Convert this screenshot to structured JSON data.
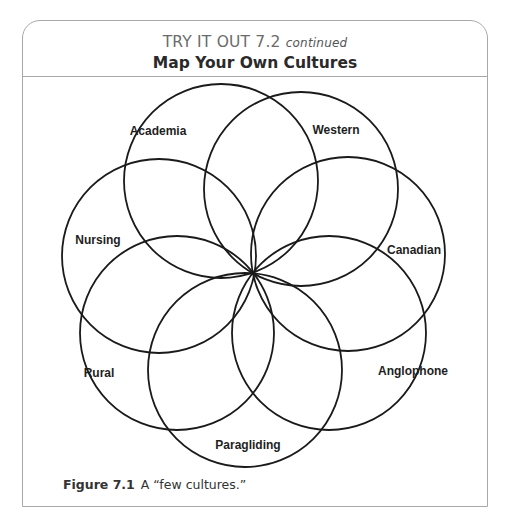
{
  "header": {
    "kicker": "TRY IT OUT 7.2",
    "kicker_suffix": "continued",
    "title": "Map Your Own Cultures"
  },
  "diagram": {
    "type": "overlapping-circles-rosette",
    "center": [
      253,
      273
    ],
    "radius": 97,
    "stroke_color": "#1a1a1a",
    "circles": [
      {
        "label": "Academia",
        "cx": 221,
        "cy": 181,
        "lx": 158,
        "ly": 135
      },
      {
        "label": "Western",
        "cx": 301,
        "cy": 189,
        "lx": 336,
        "ly": 134
      },
      {
        "label": "Canadian",
        "cx": 348,
        "cy": 254,
        "lx": 414,
        "ly": 254
      },
      {
        "label": "Anglophone",
        "cx": 329,
        "cy": 333,
        "lx": 413,
        "ly": 375
      },
      {
        "label": "Paragliding",
        "cx": 245,
        "cy": 370,
        "lx": 248,
        "ly": 449
      },
      {
        "label": "Rural",
        "cx": 177,
        "cy": 333,
        "lx": 99,
        "ly": 377
      },
      {
        "label": "Nursing",
        "cx": 159,
        "cy": 256,
        "lx": 98,
        "ly": 244
      }
    ]
  },
  "caption": {
    "figure_label": "Figure 7.1",
    "text": "A “few cultures.”"
  },
  "colors": {
    "frame_border": "#a8a8a8",
    "kicker_text": "#6b6b6b",
    "title_text": "#2a2a2a",
    "circle_stroke": "#1a1a1a"
  }
}
